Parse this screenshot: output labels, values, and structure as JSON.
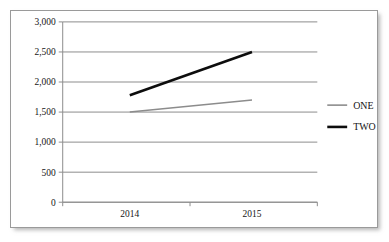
{
  "chart_data": {
    "type": "line",
    "title": "",
    "subtitle": "",
    "xlabel": "",
    "ylabel": "",
    "categories": [
      "2014",
      "2015"
    ],
    "series": [
      {
        "name": "ONE",
        "values": [
          1500,
          1700
        ],
        "color": "#8c8c8c",
        "width": 1.6
      },
      {
        "name": "TWO",
        "values": [
          1780,
          2500
        ],
        "color": "#0d0d0d",
        "width": 2.6
      }
    ],
    "ylim": [
      0,
      3000
    ],
    "ytick_values": [
      0,
      500,
      1000,
      1500,
      2000,
      2500,
      3000
    ],
    "ytick_labels": [
      "0",
      "500",
      "1,000",
      "1,500",
      "2,000",
      "2,500",
      "3,000"
    ],
    "xtick_labels": [
      "2014",
      "2015"
    ],
    "grid": true,
    "grid_axis": "y",
    "legend": true,
    "legend_position": "right",
    "legend_entries": [
      "ONE",
      "TWO"
    ],
    "plot_background": "#ffffff",
    "frame_border_color": "#9a9a9a",
    "axis_color": "#8c8c8c"
  }
}
